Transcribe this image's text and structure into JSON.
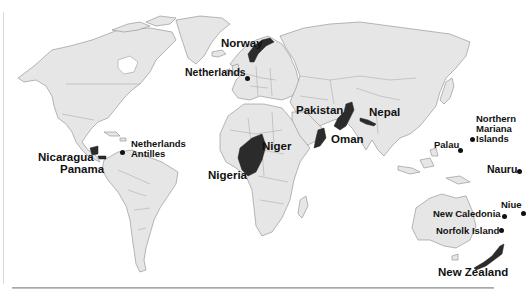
{
  "map": {
    "type": "world-political",
    "colors": {
      "land": "#e6e6e6",
      "borders": "#8a8a8a",
      "highlighted": "#2b2b2b",
      "background": "#ffffff",
      "text": "#111111"
    },
    "highlighted_countries": [
      {
        "name": "Norway",
        "label": "Norway"
      },
      {
        "name": "Nicaragua",
        "label": "Nicaragua"
      },
      {
        "name": "Panama",
        "label": "Panama"
      },
      {
        "name": "Niger",
        "label": "Niger"
      },
      {
        "name": "Nigeria",
        "label": "Nigeria"
      },
      {
        "name": "Pakistan",
        "label": "Pakistan"
      },
      {
        "name": "Oman",
        "label": "Oman"
      },
      {
        "name": "Nepal",
        "label": "Nepal"
      },
      {
        "name": "New Zealand",
        "label": "New Zealand"
      }
    ],
    "point_markers": [
      {
        "name": "Netherlands",
        "label": "Netherlands"
      },
      {
        "name": "Netherlands Antilles",
        "label_line1": "Netherlands",
        "label_line2": "Antilles"
      },
      {
        "name": "Palau",
        "label": "Palau"
      },
      {
        "name": "Northern Mariana Islands",
        "label_line1": "Northern",
        "label_line2": "Mariana",
        "label_line3": "Islands"
      },
      {
        "name": "Nauru",
        "label": "Nauru"
      },
      {
        "name": "Niue",
        "label": "Niue"
      },
      {
        "name": "New Caledonia",
        "label": "New Caledonia"
      },
      {
        "name": "Norfolk Island",
        "label": "Norfolk Island"
      }
    ]
  }
}
